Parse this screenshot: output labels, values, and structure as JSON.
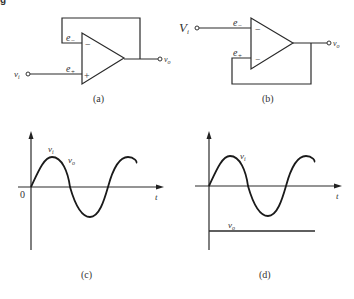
{
  "header": {
    "fragment": "g"
  },
  "panels": {
    "a": {
      "caption": "(a)",
      "input_label": "v",
      "input_sub": "i",
      "output_label": "v",
      "output_sub": "o",
      "inv_label": "e",
      "inv_sub": "−",
      "noninv_label": "e",
      "noninv_sub": "+",
      "inv_sign": "−",
      "noninv_sign": "+"
    },
    "b": {
      "caption": "(b)",
      "input_label": "V",
      "input_sub": "i",
      "output_label": "v",
      "output_sub": "o",
      "inv_label": "e",
      "inv_sub": "−",
      "noninv_label": "e",
      "noninv_sub": "+",
      "inv_sign": "−",
      "noninv_sign": "−"
    },
    "c": {
      "caption": "(c)",
      "origin_label": "0",
      "t_label": "t",
      "vi_label": "v",
      "vi_sub": "i",
      "vo_label": "v",
      "vo_sub": "o"
    },
    "d": {
      "caption": "(d)",
      "t_label": "t",
      "vi_label": "v",
      "vi_sub": "i",
      "vo_label": "v",
      "vo_sub": "o"
    }
  }
}
